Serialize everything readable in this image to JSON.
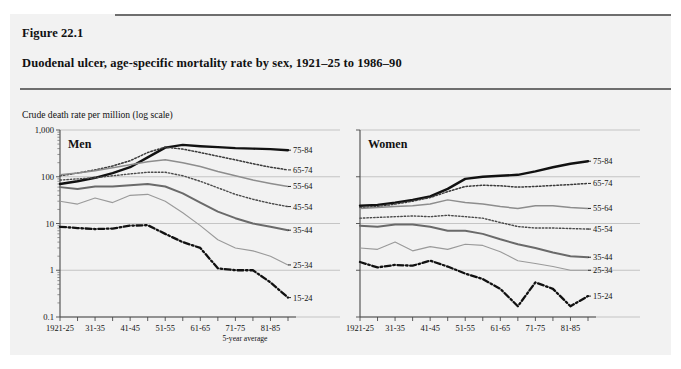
{
  "figure": {
    "number": "Figure 22.1",
    "title": "Duodenal ulcer, age-specific mortality rate by sex, 1921–25 to 1986–90"
  },
  "chart_data": {
    "type": "line",
    "title": "Duodenal ulcer, age-specific mortality rate by sex, 1921–25 to 1986–90",
    "ylabel": "Crude death rate per million (log scale)",
    "xlabel": "5-year average",
    "yscale": "log",
    "ylim": [
      0.1,
      1000
    ],
    "ytick_labels": [
      "1,000",
      "100",
      "10",
      "1",
      "0.1"
    ],
    "ytick_values": [
      1000,
      100,
      10,
      1,
      0.1
    ],
    "grid": true,
    "legend_position": "right-of-axes",
    "x": [
      "1921-25",
      "26-30",
      "31-35",
      "36-40",
      "41-45",
      "46-50",
      "51-55",
      "56-60",
      "61-65",
      "66-70",
      "71-75",
      "76-80",
      "81-85",
      "86-90"
    ],
    "xtick_labels": [
      "1921-25",
      "31-35",
      "41-45",
      "51-55",
      "61-65",
      "71-75",
      "81-85"
    ],
    "panels": [
      {
        "name": "Men",
        "series": [
          {
            "name": "75-84",
            "style": "thick-solid",
            "values": [
              70,
              80,
              95,
              120,
              160,
              260,
              420,
              480,
              450,
              430,
              410,
              400,
              390,
              370
            ]
          },
          {
            "name": "65-74",
            "style": "dotted",
            "values": [
              105,
              120,
              140,
              170,
              220,
              330,
              430,
              390,
              330,
              275,
              230,
              190,
              160,
              140
            ]
          },
          {
            "name": "55-64",
            "style": "medium-gray",
            "values": [
              110,
              120,
              135,
              155,
              180,
              210,
              230,
              200,
              165,
              130,
              105,
              85,
              72,
              62
            ]
          },
          {
            "name": "45-54",
            "style": "fine-dotted",
            "values": [
              85,
              90,
              95,
              105,
              115,
              125,
              125,
              105,
              80,
              58,
              42,
              33,
              27,
              23
            ]
          },
          {
            "name": "35-44",
            "style": "medium-dark",
            "values": [
              60,
              55,
              62,
              62,
              66,
              70,
              62,
              44,
              28,
              18,
              13,
              10,
              8.5,
              7.2
            ]
          },
          {
            "name": "25-34",
            "style": "thin-gray",
            "values": [
              30,
              26,
              35,
              28,
              40,
              42,
              30,
              17,
              9,
              4.5,
              3.0,
              2.6,
              2.0,
              1.3
            ]
          },
          {
            "name": "15-24",
            "style": "dash-dot",
            "values": [
              8.5,
              8.0,
              7.6,
              7.8,
              9.0,
              9.2,
              6.0,
              4.0,
              3.0,
              1.1,
              1.0,
              1.0,
              0.55,
              0.26
            ]
          }
        ]
      },
      {
        "name": "Women",
        "series": [
          {
            "name": "75-84",
            "style": "thick-solid",
            "values": [
              24,
              25,
              28,
              32,
              38,
              55,
              90,
              100,
              105,
              110,
              130,
              160,
              190,
              215
            ]
          },
          {
            "name": "65-74",
            "style": "dotted",
            "values": [
              22,
              23,
              26,
              30,
              36,
              48,
              62,
              66,
              64,
              60,
              62,
              65,
              68,
              72
            ]
          },
          {
            "name": "55-64",
            "style": "medium-gray",
            "values": [
              21,
              22,
              23,
              24,
              26,
              32,
              28,
              26,
              23,
              21,
              24,
              24,
              22,
              21
            ]
          },
          {
            "name": "45-54",
            "style": "fine-dotted",
            "values": [
              13,
              13.5,
              14,
              14.5,
              14,
              15,
              14,
              13,
              10.5,
              8.6,
              8.0,
              8.0,
              7.8,
              7.6
            ]
          },
          {
            "name": "35-44",
            "style": "medium-dark",
            "values": [
              9.0,
              8.5,
              9.5,
              9.5,
              8.5,
              7.0,
              7.0,
              6.0,
              4.6,
              3.6,
              3.0,
              2.4,
              2.0,
              1.9
            ]
          },
          {
            "name": "25-34",
            "style": "thin-gray",
            "values": [
              3.0,
              2.8,
              4.0,
              2.6,
              3.2,
              2.8,
              3.6,
              3.4,
              2.5,
              1.6,
              1.4,
              1.2,
              1.0,
              1.0
            ]
          },
          {
            "name": "15-24",
            "style": "dash-dot",
            "values": [
              1.5,
              1.15,
              1.3,
              1.25,
              1.6,
              1.2,
              0.85,
              0.65,
              0.4,
              0.17,
              0.55,
              0.4,
              0.17,
              0.28
            ]
          }
        ]
      }
    ]
  }
}
